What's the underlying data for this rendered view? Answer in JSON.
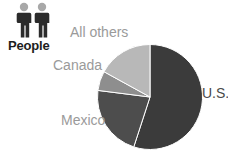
{
  "icon": {
    "name": "people-icon",
    "caption": "People",
    "figure_color": "#2b2b2b",
    "head_color": "#a8a8a8"
  },
  "labels": {
    "all_others": "All others",
    "canada": "Canada",
    "mexico": "Mexico",
    "us": "U.S.",
    "muted_color": "#9a9a9a",
    "dark_color": "#4a4a4a"
  },
  "chart_data": {
    "type": "pie",
    "title": "People",
    "categories": [
      "U.S.",
      "Mexico",
      "Canada",
      "All others"
    ],
    "values": [
      55,
      22,
      6,
      17
    ],
    "unit": "percent",
    "colors": [
      "#3b3b3b",
      "#4d4d4d",
      "#8e8e8e",
      "#b8b8b8"
    ],
    "start_angle_deg": 0,
    "direction": "clockwise",
    "legend": "outside-labels",
    "grid": false,
    "xlabel": "",
    "ylabel": ""
  }
}
